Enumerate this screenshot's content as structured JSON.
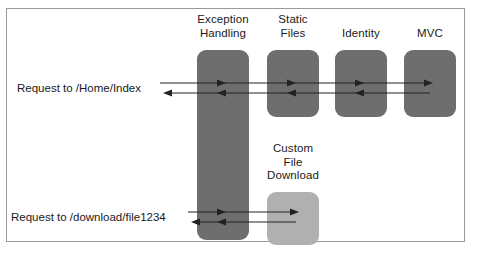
{
  "diagram": {
    "type": "middleware-pipeline",
    "frame": {
      "visible": true,
      "border_color": "#9a9a9a"
    },
    "colors": {
      "middleware_dark": "#6e6e6e",
      "middleware_light": "#b0b0b0",
      "arrow": "#222222",
      "text": "#1a1a1a",
      "background": "#ffffff"
    },
    "middleware": [
      {
        "id": "exception-handling",
        "label": "Exception\nHandling",
        "fill": "#6e6e6e",
        "spans_both_rows": true,
        "x": 197,
        "y": 50,
        "w": 52,
        "h": 190
      },
      {
        "id": "static-files",
        "label": "Static\nFiles",
        "fill": "#6e6e6e",
        "spans_both_rows": false,
        "x": 267,
        "y": 50,
        "w": 52,
        "h": 67
      },
      {
        "id": "identity",
        "label": "Identity",
        "fill": "#6e6e6e",
        "spans_both_rows": false,
        "x": 335,
        "y": 50,
        "w": 52,
        "h": 67
      },
      {
        "id": "mvc",
        "label": "MVC",
        "fill": "#6e6e6e",
        "spans_both_rows": false,
        "x": 404,
        "y": 50,
        "w": 52,
        "h": 67
      },
      {
        "id": "custom-file-download",
        "label": "Custom\nFile\nDownload",
        "fill": "#b0b0b0",
        "spans_both_rows": false,
        "x": 267,
        "y": 192,
        "w": 52,
        "h": 53
      }
    ],
    "requests": [
      {
        "id": "home-index",
        "label": "Request to /Home/Index",
        "terminates_at": "mvc",
        "inbound_y": 83,
        "outbound_y": 93
      },
      {
        "id": "file-download",
        "label": "Request to /download/file1234",
        "terminates_at": "custom-file-download",
        "inbound_y": 212,
        "outbound_y": 222
      }
    ]
  }
}
